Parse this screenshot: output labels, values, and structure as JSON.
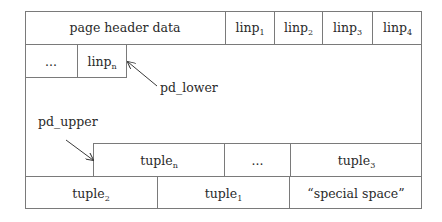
{
  "diagram": {
    "header_row": {
      "page_header": "page header data",
      "linps": [
        {
          "base": "linp",
          "sub": "1"
        },
        {
          "base": "linp",
          "sub": "2"
        },
        {
          "base": "linp",
          "sub": "3"
        },
        {
          "base": "linp",
          "sub": "4"
        }
      ]
    },
    "linp_row": {
      "ellipsis": "...",
      "last": {
        "base": "linp",
        "sub": "n"
      }
    },
    "pointers": {
      "pd_lower": "pd_lower",
      "pd_upper": "pd_upper"
    },
    "tuple_row": {
      "first": {
        "base": "tuple",
        "sub": "n"
      },
      "ellipsis": "...",
      "last": {
        "base": "tuple",
        "sub": "3"
      }
    },
    "bottom_row": {
      "tuple_a": {
        "base": "tuple",
        "sub": "2"
      },
      "tuple_b": {
        "base": "tuple",
        "sub": "1"
      },
      "special": "“special space”"
    },
    "colors": {
      "line": "#7a7a7a",
      "text": "#2a2a2a",
      "background": "#ffffff"
    }
  }
}
